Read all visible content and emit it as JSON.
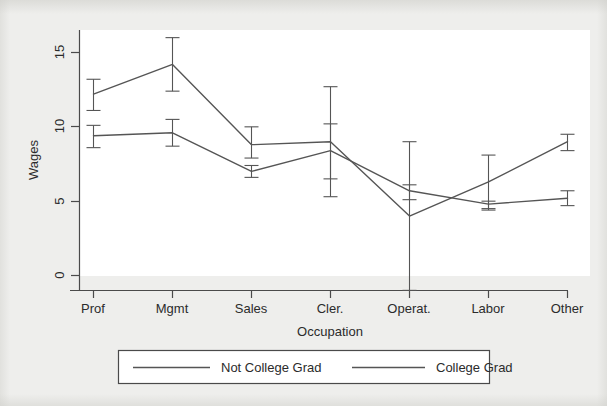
{
  "chart_data": {
    "type": "line",
    "title": "",
    "xlabel": "Occupation",
    "ylabel": "Wages",
    "categories": [
      "Prof",
      "Mgmt",
      "Sales",
      "Cler.",
      "Operat.",
      "Labor",
      "Other"
    ],
    "ylim": [
      -1.6,
      16.4
    ],
    "yticks": [
      0,
      5,
      10,
      15
    ],
    "ytick_labels": [
      "0",
      "5",
      "10",
      "15"
    ],
    "xlim": [
      0,
      8
    ],
    "grid": false,
    "legend_position": "below-axes",
    "error_bars": true,
    "series": [
      {
        "name": "Not College Grad",
        "color": "#555555",
        "values": [
          12.2,
          14.2,
          8.8,
          9.0,
          4.0,
          6.3,
          9.0
        ],
        "err_low": [
          11.1,
          12.4,
          7.9,
          6.5,
          -1.0,
          4.5,
          8.4
        ],
        "err_high": [
          13.2,
          16.0,
          10.0,
          12.7,
          9.0,
          8.1,
          9.5
        ]
      },
      {
        "name": "College Grad",
        "color": "#555555",
        "values": [
          9.4,
          9.6,
          7.0,
          8.4,
          5.7,
          4.8,
          5.2
        ],
        "err_low": [
          8.6,
          8.7,
          6.6,
          5.3,
          5.1,
          4.4,
          4.7
        ],
        "err_high": [
          10.1,
          10.5,
          7.4,
          10.2,
          6.1,
          5.0,
          5.7
        ]
      }
    ],
    "legend": [
      {
        "label": "Not College Grad",
        "color": "#555555"
      },
      {
        "label": "College Grad",
        "color": "#555555"
      }
    ]
  },
  "axis": {
    "y_title": "Wages",
    "x_title": "Occupation",
    "y_tick_0": "0",
    "y_tick_5": "5",
    "y_tick_10": "10",
    "y_tick_15": "15",
    "x_tick_0": "Prof",
    "x_tick_1": "Mgmt",
    "x_tick_2": "Sales",
    "x_tick_3": "Cler.",
    "x_tick_4": "Operat.",
    "x_tick_5": "Labor",
    "x_tick_6": "Other"
  },
  "legend": {
    "item_0_label": "Not College Grad",
    "item_1_label": "College Grad"
  },
  "colors": {
    "background": "#eeeeec",
    "plot_area": "#ffffff",
    "axis": "#4a4a4a",
    "series_line": "#555555",
    "text": "#2b2b2b"
  }
}
